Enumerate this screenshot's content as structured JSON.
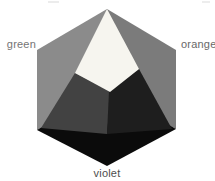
{
  "diagram": {
    "kind": "color-hexagon-pyramid",
    "background": "#ffffff",
    "labels": {
      "green": {
        "text": "green",
        "color": "#757575"
      },
      "orange": {
        "text": "orange",
        "color": "#686868"
      },
      "violet": {
        "text": "violet",
        "color": "#4e4e4e"
      }
    },
    "region_colors": {
      "outer_left_green": "#8b8b8b",
      "outer_right_orange": "#7b7b7b",
      "bottom_violet": "#0b0b0b",
      "inner_left_face": "#424242",
      "inner_right_face": "#1e1e1e",
      "top_white_face": "#f6f5ef"
    },
    "regions": [
      {
        "name": "outer-left-green-region",
        "fill": "#8b8b8b",
        "points": "107,9 37,50 37,130 107,90"
      },
      {
        "name": "outer-right-orange-region",
        "fill": "#7b7b7b",
        "points": "107,9 176,50 176,129 107,90"
      },
      {
        "name": "bottom-violet-region",
        "fill": "#0b0b0b",
        "points": "37,130 107,88 176,129 107,166"
      },
      {
        "name": "inner-left-pyramid-face",
        "fill": "#424242",
        "points": "75,73 111,91 107,134 41,128"
      },
      {
        "name": "inner-right-pyramid-face",
        "fill": "#1e1e1e",
        "points": "139,69 172,129 107,134 109,91"
      },
      {
        "name": "top-white-pyramid-face",
        "fill": "#f6f5ef",
        "points": "107,9 75,73 110,92 139,69"
      }
    ],
    "specks": [
      {
        "name": "scan-speck-left",
        "fill": "#ececec",
        "points": "48,1 59,1 59,3 48,3"
      },
      {
        "name": "scan-speck-right",
        "fill": "#ededed",
        "points": "202,1 210,1 210,3 202,3"
      }
    ]
  }
}
